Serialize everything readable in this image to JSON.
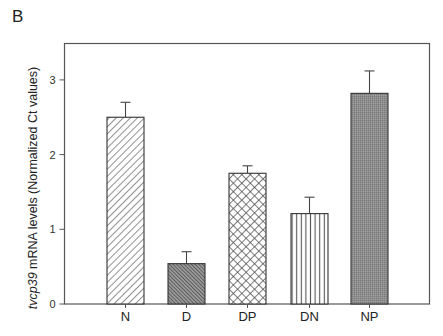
{
  "panel_label": "B",
  "chart_data": {
    "type": "bar",
    "title": "",
    "xlabel": "",
    "ylabel": "tvcp39 mRNA levels (Normalized Ct values)",
    "ylabel_italic_part": "tvcp39",
    "ylabel_rest": " mRNA levels (Normalized Ct values)",
    "categories": [
      "N",
      "D",
      "DP",
      "DN",
      "NP"
    ],
    "values": [
      2.5,
      0.54,
      1.75,
      1.21,
      2.82
    ],
    "error_upper": [
      0.2,
      0.16,
      0.1,
      0.22,
      0.3
    ],
    "patterns": [
      "diag-up",
      "diag-down-dense",
      "crosshatch",
      "vertical",
      "dense-gray"
    ],
    "ylim": [
      0,
      3.5
    ],
    "yticks": [
      0,
      1,
      2,
      3
    ],
    "grid": false,
    "legend": null
  }
}
